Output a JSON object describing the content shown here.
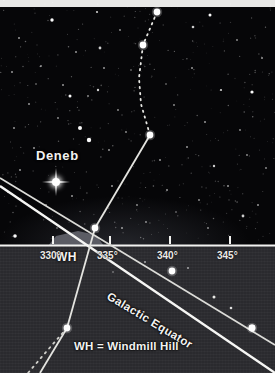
{
  "figure": {
    "type": "sky-chart",
    "title_star": "Deneb",
    "equator_label": "Galactic Equator",
    "horizon_marker": "WH",
    "legend": "WH = Windmill Hill",
    "colors": {
      "sky": "#060608",
      "ground": "#2a2a2e",
      "line": "#f2f2f0",
      "star": "#ffffff",
      "border": "#e8e8e6",
      "hill": "#6a6a70"
    }
  },
  "axis": {
    "name": "galactic-longitude-axis",
    "units": "degrees",
    "ticks": [
      {
        "label": "330°",
        "x": 53,
        "value": 330
      },
      {
        "label": "335°",
        "x": 110,
        "value": 335
      },
      {
        "label": "340°",
        "x": 170,
        "value": 340
      },
      {
        "label": "345°",
        "x": 230,
        "value": 345
      }
    ],
    "horizon_y": 245
  },
  "stars": {
    "named": [
      {
        "name": "Deneb",
        "x": 56,
        "y": 182,
        "mag": "bright"
      }
    ],
    "nodes": [
      {
        "x": 157,
        "y": 12
      },
      {
        "x": 143,
        "y": 45
      },
      {
        "x": 150,
        "y": 135
      },
      {
        "x": 95,
        "y": 228
      },
      {
        "x": 67,
        "y": 328
      },
      {
        "x": 172,
        "y": 271
      },
      {
        "x": 252,
        "y": 328
      }
    ],
    "field": [
      {
        "x": 52,
        "y": 20,
        "r": 1.7
      },
      {
        "x": 97,
        "y": 12,
        "r": 1.1
      },
      {
        "x": 210,
        "y": 15,
        "r": 1.5
      },
      {
        "x": 19,
        "y": 38,
        "r": 1.0
      },
      {
        "x": 76,
        "y": 52,
        "r": 1.0
      },
      {
        "x": 120,
        "y": 30,
        "r": 0.9
      },
      {
        "x": 193,
        "y": 27,
        "r": 1.3
      },
      {
        "x": 237,
        "y": 40,
        "r": 0.9
      },
      {
        "x": 262,
        "y": 58,
        "r": 1.0
      },
      {
        "x": 12,
        "y": 72,
        "r": 1.0
      },
      {
        "x": 41,
        "y": 66,
        "r": 0.9
      },
      {
        "x": 63,
        "y": 85,
        "r": 1.0
      },
      {
        "x": 100,
        "y": 48,
        "r": 1.4
      },
      {
        "x": 104,
        "y": 68,
        "r": 1.0
      },
      {
        "x": 88,
        "y": 96,
        "r": 0.9
      },
      {
        "x": 29,
        "y": 104,
        "r": 1.0
      },
      {
        "x": 58,
        "y": 118,
        "r": 0.9
      },
      {
        "x": 14,
        "y": 128,
        "r": 1.0
      },
      {
        "x": 70,
        "y": 96,
        "r": 1.5
      },
      {
        "x": 98,
        "y": 90,
        "r": 1.2
      },
      {
        "x": 118,
        "y": 110,
        "r": 0.9
      },
      {
        "x": 192,
        "y": 68,
        "r": 1.0
      },
      {
        "x": 221,
        "y": 90,
        "r": 1.1
      },
      {
        "x": 252,
        "y": 92,
        "r": 1.6
      },
      {
        "x": 174,
        "y": 105,
        "r": 0.9
      },
      {
        "x": 205,
        "y": 122,
        "r": 1.0
      },
      {
        "x": 240,
        "y": 130,
        "r": 0.9
      },
      {
        "x": 80,
        "y": 128,
        "r": 2.0
      },
      {
        "x": 89,
        "y": 140,
        "r": 2.2
      },
      {
        "x": 34,
        "y": 148,
        "r": 1.0
      },
      {
        "x": 109,
        "y": 150,
        "r": 1.0
      },
      {
        "x": 126,
        "y": 132,
        "r": 0.9
      },
      {
        "x": 160,
        "y": 160,
        "r": 1.0
      },
      {
        "x": 187,
        "y": 147,
        "r": 1.0
      },
      {
        "x": 214,
        "y": 166,
        "r": 1.2
      },
      {
        "x": 247,
        "y": 155,
        "r": 0.9
      },
      {
        "x": 20,
        "y": 170,
        "r": 1.0
      },
      {
        "x": 8,
        "y": 192,
        "r": 1.0
      },
      {
        "x": 46,
        "y": 205,
        "r": 0.9
      },
      {
        "x": 72,
        "y": 196,
        "r": 1.0
      },
      {
        "x": 112,
        "y": 186,
        "r": 1.0
      },
      {
        "x": 137,
        "y": 205,
        "r": 0.9
      },
      {
        "x": 167,
        "y": 190,
        "r": 1.0
      },
      {
        "x": 199,
        "y": 200,
        "r": 0.9
      },
      {
        "x": 228,
        "y": 186,
        "r": 1.0
      },
      {
        "x": 258,
        "y": 205,
        "r": 1.0
      },
      {
        "x": 243,
        "y": 216,
        "r": 1.4
      },
      {
        "x": 15,
        "y": 236,
        "r": 1.8
      },
      {
        "x": 122,
        "y": 228,
        "r": 1.0
      },
      {
        "x": 146,
        "y": 222,
        "r": 0.9
      },
      {
        "x": 208,
        "y": 228,
        "r": 0.9
      },
      {
        "x": 57,
        "y": 228,
        "r": 0.8
      },
      {
        "x": 176,
        "y": 212,
        "r": 0.8
      },
      {
        "x": 266,
        "y": 168,
        "r": 0.9
      },
      {
        "x": 131,
        "y": 70,
        "r": 0.8
      },
      {
        "x": 166,
        "y": 84,
        "r": 0.8
      },
      {
        "x": 36,
        "y": 84,
        "r": 0.8
      },
      {
        "x": 188,
        "y": 268,
        "r": 1.0
      },
      {
        "x": 145,
        "y": 262,
        "r": 1.0
      },
      {
        "x": 113,
        "y": 272,
        "r": 0.8
      }
    ]
  },
  "lines": {
    "galactic_equator": {
      "x1": 0,
      "y1": 186,
      "x2": 275,
      "y2": 373
    },
    "upper_track": {
      "x1": 0,
      "y1": 178,
      "x2": 275,
      "y2": 345
    },
    "constellation": [
      {
        "x1": 150,
        "y1": 135,
        "x2": 95,
        "y2": 228
      },
      {
        "x1": 95,
        "y1": 228,
        "x2": 67,
        "y2": 328
      },
      {
        "x1": 67,
        "y1": 328,
        "x2": 40,
        "y2": 373
      }
    ]
  }
}
